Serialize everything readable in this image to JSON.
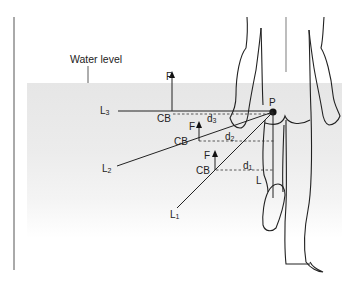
{
  "diagram": {
    "labels": {
      "water_level": "Water level",
      "pivot": "P",
      "force": "F",
      "center_of_buoyancy": "CB",
      "lever_L3": "L",
      "lever_L3_sub": "3",
      "lever_L2": "L",
      "lever_L2_sub": "2",
      "lever_L1": "L",
      "lever_L1_sub": "1",
      "lever_L": "L",
      "dist_d3": "d",
      "dist_d3_sub": "3",
      "dist_d2": "d",
      "dist_d2_sub": "2",
      "dist_d1": "d",
      "dist_d1_sub": "1"
    },
    "colors": {
      "line": "#222222",
      "water": "#e6e6e6",
      "background": "#ffffff"
    }
  }
}
